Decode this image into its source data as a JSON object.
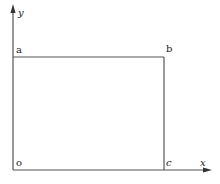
{
  "diagram": {
    "type": "coordinate-rectangle",
    "axes": {
      "x_label": "x",
      "y_label": "y"
    },
    "points": {
      "origin": "o",
      "top_left": "a",
      "top_right": "b",
      "bottom_right": "c"
    },
    "colors": {
      "line": "#555555",
      "text": "#222222",
      "background": "#ffffff"
    }
  }
}
